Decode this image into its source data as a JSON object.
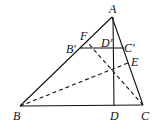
{
  "diagram": {
    "type": "geometry-triangle",
    "points": {
      "A": {
        "label": "A",
        "x": 112,
        "y": 17
      },
      "B": {
        "label": "B",
        "x": 20,
        "y": 106
      },
      "C": {
        "label": "C",
        "x": 143,
        "y": 105
      },
      "D": {
        "label": "D",
        "x": 114,
        "y": 106
      },
      "B_prime": {
        "label": "B′",
        "x": 80,
        "y": 48
      },
      "C_prime": {
        "label": "C′",
        "x": 124,
        "y": 48
      },
      "D_prime": {
        "label": "D′",
        "x": 114,
        "y": 48
      },
      "E": {
        "label": "E",
        "x": 128,
        "y": 63
      },
      "F": {
        "label": "F",
        "x": 87,
        "y": 42
      },
      "H": {
        "x": 114,
        "y": 70
      }
    },
    "solid_segments": [
      "AB",
      "AC",
      "BC",
      "AD",
      "B′C′"
    ],
    "dashed_segments": [
      "BE",
      "CF"
    ],
    "line_color": "#111111"
  }
}
